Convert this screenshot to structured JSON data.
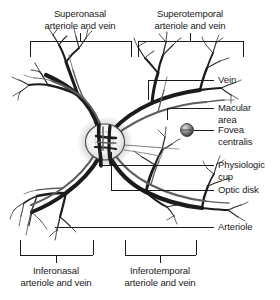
{
  "figure": {
    "background_color": "#ffffff",
    "ink_color": "#1a1a1a",
    "width": 280,
    "height": 300
  },
  "quadrant_labels": [
    {
      "id": "superonasal",
      "line1": "Superonasal",
      "line2": "arteriole and vein",
      "position": "top-left"
    },
    {
      "id": "superotemporal",
      "line1": "Superotemporal",
      "line2": "arteriole and vein",
      "position": "top-right"
    },
    {
      "id": "inferonasal",
      "line1": "Inferonasal",
      "line2": "arteriole and vein",
      "position": "bottom-left"
    },
    {
      "id": "inferotemporal",
      "line1": "Inferotemporal",
      "line2": "arteriole and vein",
      "position": "bottom-right"
    }
  ],
  "callout_labels": [
    {
      "id": "vein",
      "line1": "Vein",
      "line2": ""
    },
    {
      "id": "macular-area",
      "line1": "Macular",
      "line2": "area"
    },
    {
      "id": "fovea-centralis",
      "line1": "Fovea",
      "line2": "centralis"
    },
    {
      "id": "physiologic-cup",
      "line1": "Physiologic",
      "line2": "cup"
    },
    {
      "id": "optic-disk",
      "line1": "Optic disk",
      "line2": ""
    },
    {
      "id": "arteriole",
      "line1": "Arteriole",
      "line2": ""
    }
  ],
  "structures": {
    "optic_disk": {
      "label": "optic disk",
      "shape": "ellipse",
      "fill": "#f2f2f2"
    },
    "fovea_centralis": {
      "label": "fovea centralis",
      "shape": "shaded-sphere",
      "fill": "#8c8c8c"
    }
  }
}
